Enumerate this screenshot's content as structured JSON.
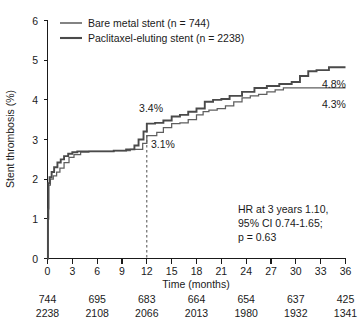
{
  "chart_data": {
    "type": "line",
    "title": "",
    "xlabel": "Time (months)",
    "ylabel": "Stent thrombosis (%)",
    "xlim": [
      0,
      36
    ],
    "ylim": [
      0,
      6
    ],
    "xticks": [
      0,
      3,
      6,
      9,
      12,
      15,
      18,
      21,
      24,
      27,
      30,
      33,
      36
    ],
    "yticks": [
      0,
      1,
      2,
      3,
      4,
      5,
      6
    ],
    "grid": false,
    "legend_position": "top-left",
    "series": [
      {
        "name": "Bare metal stent (n = 744)",
        "key": "bms",
        "color": "#5f5f5f",
        "n": 744,
        "points": [
          [
            0.0,
            0.0
          ],
          [
            0.08,
            1.25
          ],
          [
            0.15,
            1.85
          ],
          [
            0.35,
            2.0
          ],
          [
            0.7,
            2.08
          ],
          [
            1.1,
            2.18
          ],
          [
            1.5,
            2.28
          ],
          [
            2.0,
            2.42
          ],
          [
            2.6,
            2.55
          ],
          [
            3.2,
            2.62
          ],
          [
            4.0,
            2.68
          ],
          [
            5.0,
            2.7
          ],
          [
            6.2,
            2.7
          ],
          [
            8.0,
            2.72
          ],
          [
            10.0,
            2.75
          ],
          [
            11.5,
            2.9
          ],
          [
            12.0,
            3.1
          ],
          [
            13.2,
            3.18
          ],
          [
            14.0,
            3.3
          ],
          [
            15.0,
            3.4
          ],
          [
            16.0,
            3.42
          ],
          [
            17.0,
            3.5
          ],
          [
            18.0,
            3.62
          ],
          [
            18.8,
            3.7
          ],
          [
            19.5,
            3.74
          ],
          [
            20.5,
            3.78
          ],
          [
            21.5,
            3.85
          ],
          [
            22.5,
            3.95
          ],
          [
            23.5,
            4.05
          ],
          [
            24.5,
            4.1
          ],
          [
            25.5,
            4.14
          ],
          [
            26.5,
            4.2
          ],
          [
            27.5,
            4.25
          ],
          [
            28.5,
            4.3
          ],
          [
            30.0,
            4.3
          ],
          [
            33.0,
            4.3
          ],
          [
            36.0,
            4.3
          ]
        ],
        "end_label": "4.3%",
        "mid_label": "3.1%"
      },
      {
        "name": "Paclitaxel-eluting stent (n = 2238)",
        "key": "pes",
        "color": "#4a4a4a",
        "n": 2238,
        "points": [
          [
            0.0,
            0.0
          ],
          [
            0.05,
            1.0
          ],
          [
            0.1,
            1.9
          ],
          [
            0.25,
            2.05
          ],
          [
            0.5,
            2.18
          ],
          [
            0.8,
            2.3
          ],
          [
            1.2,
            2.42
          ],
          [
            1.6,
            2.5
          ],
          [
            2.0,
            2.58
          ],
          [
            2.5,
            2.64
          ],
          [
            3.0,
            2.68
          ],
          [
            3.6,
            2.7
          ],
          [
            4.5,
            2.7
          ],
          [
            6.0,
            2.7
          ],
          [
            8.0,
            2.72
          ],
          [
            9.5,
            2.75
          ],
          [
            10.5,
            2.85
          ],
          [
            11.0,
            3.0
          ],
          [
            11.6,
            3.2
          ],
          [
            12.0,
            3.4
          ],
          [
            13.0,
            3.42
          ],
          [
            14.0,
            3.48
          ],
          [
            15.0,
            3.58
          ],
          [
            16.0,
            3.62
          ],
          [
            17.0,
            3.7
          ],
          [
            18.0,
            3.78
          ],
          [
            19.0,
            3.95
          ],
          [
            20.0,
            4.0
          ],
          [
            21.0,
            4.02
          ],
          [
            22.0,
            4.1
          ],
          [
            23.5,
            4.2
          ],
          [
            25.0,
            4.3
          ],
          [
            26.5,
            4.35
          ],
          [
            28.0,
            4.4
          ],
          [
            29.5,
            4.45
          ],
          [
            30.5,
            4.6
          ],
          [
            31.5,
            4.72
          ],
          [
            32.5,
            4.75
          ],
          [
            34.0,
            4.82
          ],
          [
            36.0,
            4.82
          ]
        ],
        "end_label": "4.8%",
        "mid_label": "3.4%"
      }
    ],
    "annotations": {
      "marker_month": 12,
      "bms_at_12": "3.1%",
      "pes_at_12": "3.4%",
      "bms_at_36": "4.3%",
      "pes_at_36": "4.8%"
    },
    "statistics": {
      "line1": "HR at 3 years 1.10,",
      "line2": "95% CI 0.74-1.65;",
      "line3": "p = 0.63"
    },
    "at_risk": {
      "times": [
        0,
        6,
        12,
        18,
        24,
        30,
        36
      ],
      "rows": [
        {
          "series": "Bare metal stent",
          "values": [
            "744",
            "695",
            "683",
            "664",
            "654",
            "637",
            "425"
          ]
        },
        {
          "series": "Paclitaxel-eluting stent",
          "values": [
            "2238",
            "2108",
            "2066",
            "2013",
            "1980",
            "1932",
            "1341"
          ]
        }
      ]
    }
  }
}
